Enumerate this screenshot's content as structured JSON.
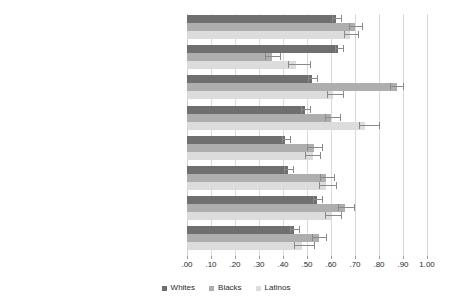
{
  "chart_data": {
    "type": "bar",
    "orientation": "horizontal",
    "title": "",
    "xlabel": "",
    "ylabel": "",
    "xlim": [
      0.0,
      1.0
    ],
    "xticks": [
      0.0,
      0.1,
      0.2,
      0.3,
      0.4,
      0.5,
      0.6,
      0.7,
      0.8,
      0.9,
      1.0
    ],
    "xtick_labels": [
      ".00",
      ".10",
      ".20",
      ".30",
      ".40",
      ".50",
      ".60",
      ".70",
      ".80",
      ".90",
      "1.00"
    ],
    "grid": true,
    "legend_position": "bottom",
    "error_bars": true,
    "categories": [
      "GEI",
      "Empathy for Whites",
      "Empathy for Blacks",
      "Empathy for Latinos",
      "Empathy for Arabs",
      "Empathy for Undocumented Immigrants",
      "Empathy for Native Americans",
      "Empathy for LGBTQ"
    ],
    "series": [
      {
        "name": "Whites",
        "color": "#6f6f6f",
        "values": [
          0.62,
          0.63,
          0.52,
          0.49,
          0.41,
          0.42,
          0.54,
          0.445
        ],
        "ci_low": [
          0.605,
          0.615,
          0.505,
          0.475,
          0.395,
          0.405,
          0.525,
          0.43
        ],
        "ci_high": [
          0.645,
          0.655,
          0.545,
          0.515,
          0.435,
          0.445,
          0.565,
          0.47
        ]
      },
      {
        "name": "Blacks",
        "color": "#aeaeae",
        "values": [
          0.7,
          0.355,
          0.875,
          0.6,
          0.53,
          0.58,
          0.66,
          0.55
        ],
        "ci_low": [
          0.675,
          0.325,
          0.845,
          0.575,
          0.5,
          0.555,
          0.63,
          0.52
        ],
        "ci_high": [
          0.735,
          0.39,
          0.905,
          0.64,
          0.565,
          0.615,
          0.7,
          0.585
        ]
      },
      {
        "name": "Latinos",
        "color": "#dcdcdc",
        "values": [
          0.68,
          0.455,
          0.61,
          0.74,
          0.525,
          0.58,
          0.6,
          0.48
        ],
        "ci_low": [
          0.655,
          0.42,
          0.585,
          0.715,
          0.49,
          0.55,
          0.575,
          0.445
        ],
        "ci_high": [
          0.715,
          0.515,
          0.655,
          0.805,
          0.56,
          0.625,
          0.645,
          0.535
        ]
      }
    ]
  },
  "legend": {
    "items": [
      {
        "label": "Whites"
      },
      {
        "label": "Blacks"
      },
      {
        "label": "Latinos"
      }
    ]
  }
}
